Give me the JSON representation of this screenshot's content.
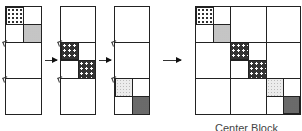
{
  "figure": {
    "panels": [
      {
        "id": "panel-1",
        "filled_blocks": [
          "top-left checker",
          "top-right light stipple"
        ]
      },
      {
        "id": "panel-2",
        "filled_blocks": [
          "middle dark dotted",
          "middle dark dotted"
        ]
      },
      {
        "id": "panel-3",
        "filled_blocks": [
          "bottom light stipple",
          "bottom dark stipple"
        ]
      }
    ],
    "result": {
      "grid": "3x3 blocks",
      "diagonal_blocks": 6
    },
    "arrows": [
      "→",
      "→",
      "→"
    ],
    "caption": "Center Block"
  }
}
